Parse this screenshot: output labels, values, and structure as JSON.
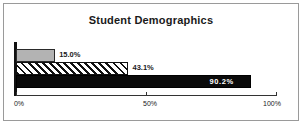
{
  "chart_data": {
    "type": "bar",
    "orientation": "horizontal",
    "title": "Student Demographics",
    "xlabel": "",
    "ylabel": "",
    "categories": [
      "",
      "",
      ""
    ],
    "values": [
      15.0,
      43.1,
      90.2
    ],
    "data_labels": [
      "15.0%",
      "43.1%",
      "90.2%"
    ],
    "xlim": [
      0,
      100
    ],
    "xticks": [
      0,
      50,
      100
    ],
    "xtick_labels": [
      "0%",
      "50%",
      "100%"
    ],
    "grid": false,
    "legend": "none",
    "series_styles": [
      "solid-gray",
      "hatched",
      "solid-black"
    ],
    "colors": {
      "bar_gray": "#b3b3b3",
      "bar_black": "#0a0a0a",
      "hatch": "#111111",
      "axis": "#111111",
      "text": "#1a1a1a",
      "label_on_dark": "#ffffff",
      "frame_border": "#9a9a9a",
      "background": "#ffffff"
    }
  }
}
